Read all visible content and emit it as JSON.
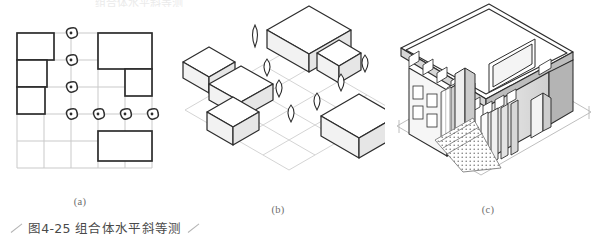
{
  "figure": {
    "caption": "图4-25  组合体水平斜等测",
    "top_cropped_text": "组合体水平斜等测",
    "sub_labels": {
      "a": "(a)",
      "b": "(b)",
      "c": "(c)"
    }
  },
  "colors": {
    "ink": "#2d2d2d",
    "grid_light": "#c9c9c9",
    "grid_faint": "#d8d8d8",
    "caption": "#4a4a4a",
    "label": "#6d6d6d",
    "shade": "#e8e8e8",
    "shade_dark": "#b9b9b9",
    "paper": "#ffffff"
  },
  "panel_a": {
    "name": "plan-view",
    "description": "方格网平面图：建筑物矩形轮廓与树木符号",
    "grid": {
      "columns": 5,
      "rows": 5,
      "cell": 27
    },
    "buildings": [
      {
        "id": "b1",
        "col": 0,
        "row": 0,
        "w": 2,
        "h": 1
      },
      {
        "id": "b2",
        "col": 0,
        "row": 1,
        "w": 1.6,
        "h": 1
      },
      {
        "id": "b3",
        "col": 0,
        "row": 2,
        "w": 1.5,
        "h": 1
      },
      {
        "id": "b4",
        "col": 3,
        "row": 0,
        "w": 2,
        "h": 1.3
      },
      {
        "id": "b5",
        "col": 4,
        "row": 1.3,
        "w": 1,
        "h": 1
      },
      {
        "id": "b6",
        "col": 3,
        "row": 3.6,
        "w": 2,
        "h": 1.1
      }
    ],
    "trees": [
      {
        "col": 2,
        "row": 0
      },
      {
        "col": 2,
        "row": 1
      },
      {
        "col": 2,
        "row": 2
      },
      {
        "col": 2,
        "row": 3
      },
      {
        "col": 3,
        "row": 3
      },
      {
        "col": 4,
        "row": 3
      },
      {
        "col": 5,
        "row": 3
      }
    ]
  },
  "panel_b": {
    "name": "horizontal-oblique-axonometric",
    "description": "水平斜等测：方格网与体块、树木立体表达",
    "grid": {
      "columns": 4,
      "rows": 4
    },
    "blocks": 6,
    "trees": 7
  },
  "panel_c": {
    "name": "building-axonometric",
    "description": "建筑水平斜等测渲染图：屋顶女儿墙、带形窗、门廊、铺地",
    "window_bands": 3,
    "has_ground_lines": true
  }
}
